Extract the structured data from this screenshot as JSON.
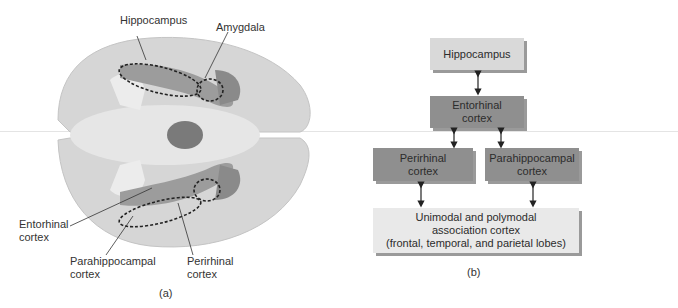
{
  "panel_a": {
    "caption": "(a)",
    "labels": {
      "hippocampus": "Hippocampus",
      "amygdala": "Amygdala",
      "entorhinal": [
        "Entorhinal",
        "cortex"
      ],
      "parahippocampal": [
        "Parahippocampal",
        "cortex"
      ],
      "perirhinal": [
        "Perirhinal",
        "cortex"
      ]
    }
  },
  "panel_b": {
    "caption": "(b)",
    "boxes": {
      "hippocampus": "Hippocampus",
      "entorhinal": [
        "Entorhinal",
        "cortex"
      ],
      "perirhinal": [
        "Perirhinal",
        "cortex"
      ],
      "parahippocampal": [
        "Parahippocampal",
        "cortex"
      ],
      "association": [
        "Unimodal and polymodal",
        "association cortex",
        "(frontal, temporal, and parietal lobes)"
      ]
    }
  },
  "colors": {
    "light_box": "#d9d9d9",
    "dark_box": "#8f8f8f",
    "pale_box": "#e9e9e9"
  }
}
